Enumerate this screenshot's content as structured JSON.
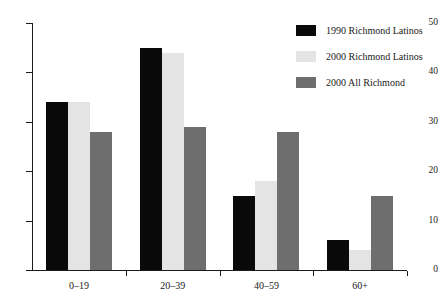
{
  "chart_data": {
    "type": "bar",
    "title": "",
    "xlabel": "",
    "ylabel": "",
    "ylim": [
      0,
      50
    ],
    "yticks": [
      0,
      10,
      20,
      30,
      40,
      50
    ],
    "grid": false,
    "legend_position": "top-right",
    "categories": [
      "0–19",
      "20–39",
      "40–59",
      "60+"
    ],
    "series": [
      {
        "name": "1990 Richmond Latinos",
        "color": "#0a0a0a",
        "values": [
          34,
          45,
          15,
          6
        ]
      },
      {
        "name": "2000 Richmond Latinos",
        "color": "#e4e4e4",
        "values": [
          34,
          44,
          18,
          4
        ]
      },
      {
        "name": "2000 All Richmond",
        "color": "#6e6e6e",
        "values": [
          28,
          29,
          28,
          15
        ]
      }
    ]
  }
}
